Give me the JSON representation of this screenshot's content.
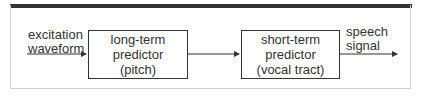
{
  "diagram": {
    "input_label": [
      "excitation",
      "waveform"
    ],
    "blocks": [
      {
        "lines": [
          "long-term",
          "predictor",
          "(pitch)"
        ]
      },
      {
        "lines": [
          "short-term",
          "predictor",
          "(vocal tract)"
        ]
      }
    ],
    "output_label": [
      "speech",
      "signal"
    ],
    "colors": {
      "line": "#333333",
      "frame": "#cfcfcf",
      "background": "#ffffff"
    }
  }
}
